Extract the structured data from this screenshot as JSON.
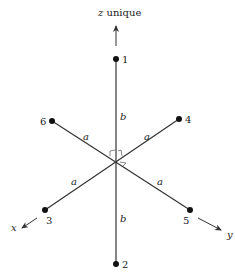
{
  "title": {
    "axis_letter": "z",
    "suffix": " unique"
  },
  "axes": {
    "x": "x",
    "y": "y"
  },
  "atoms": [
    {
      "id": "1",
      "label": "1"
    },
    {
      "id": "2",
      "label": "2"
    },
    {
      "id": "3",
      "label": "3"
    },
    {
      "id": "4",
      "label": "4"
    },
    {
      "id": "5",
      "label": "5"
    },
    {
      "id": "6",
      "label": "6"
    }
  ],
  "bonds": {
    "top": "b",
    "bottom": "b",
    "upper_left": "a",
    "upper_right": "a",
    "lower_left": "a",
    "lower_right": "a"
  },
  "colors": {
    "line": "#333333",
    "text": "#222222",
    "background": "#ffffff"
  }
}
